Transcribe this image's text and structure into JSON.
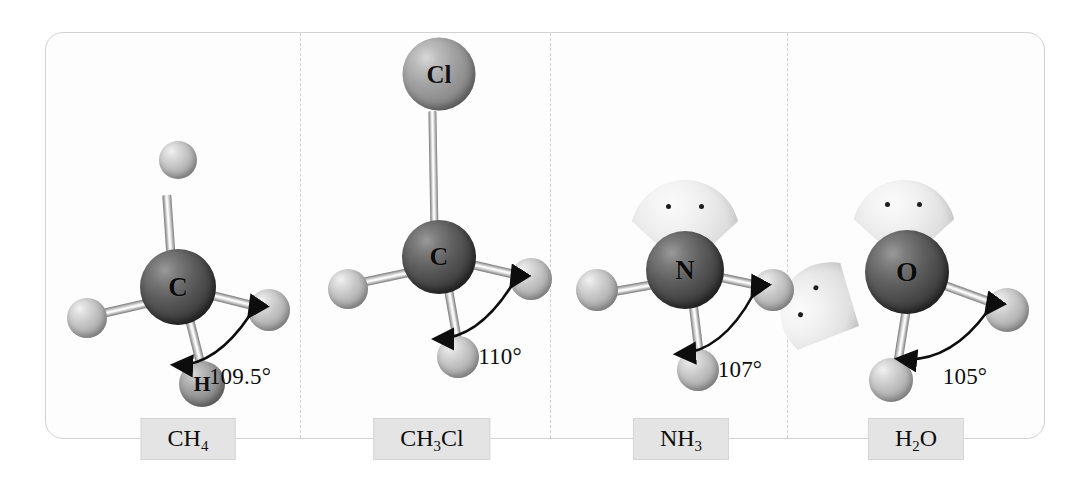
{
  "figure": {
    "background_color": "#ffffff",
    "frame_color": "#d2d2d2",
    "divider_color": "#cfcfcf",
    "chip_color": "#e4e4e4"
  },
  "panels": [
    {
      "id": "ch4",
      "formula_html": "CH<sub>4</sub>",
      "formula_text": "CH4",
      "central_atom": "C",
      "central_shade": "dark",
      "angle": "109.5°",
      "lone_pairs": 0,
      "terminal_atoms": [
        {
          "label": "",
          "shade": "light",
          "position": "top"
        },
        {
          "label": "",
          "shade": "light",
          "position": "left"
        },
        {
          "label": "H",
          "shade": "mid",
          "position": "bottom"
        },
        {
          "label": "",
          "shade": "light",
          "position": "right"
        }
      ]
    },
    {
      "id": "ch3cl",
      "formula_html": "CH<sub>3</sub>Cl",
      "formula_text": "CH3Cl",
      "central_atom": "C",
      "central_shade": "dark",
      "angle": "110°",
      "lone_pairs": 0,
      "terminal_atoms": [
        {
          "label": "Cl",
          "shade": "mid",
          "position": "top"
        },
        {
          "label": "",
          "shade": "light",
          "position": "left"
        },
        {
          "label": "",
          "shade": "light",
          "position": "bottom"
        },
        {
          "label": "",
          "shade": "light",
          "position": "right"
        }
      ]
    },
    {
      "id": "nh3",
      "formula_html": "NH<sub>3</sub>",
      "formula_text": "NH3",
      "central_atom": "N",
      "central_shade": "dark",
      "angle": "107°",
      "lone_pairs": 1,
      "terminal_atoms": [
        {
          "label": "",
          "shade": "light",
          "position": "left"
        },
        {
          "label": "",
          "shade": "light",
          "position": "bottom"
        },
        {
          "label": "",
          "shade": "light",
          "position": "right"
        }
      ]
    },
    {
      "id": "h2o",
      "formula_html": "H<sub>2</sub>O",
      "formula_text": "H2O",
      "central_atom": "O",
      "central_shade": "dark",
      "angle": "105°",
      "lone_pairs": 2,
      "terminal_atoms": [
        {
          "label": "",
          "shade": "light",
          "position": "bottom-left"
        },
        {
          "label": "",
          "shade": "light",
          "position": "right"
        }
      ]
    }
  ],
  "labels": {
    "ch4_angle": "109.5°",
    "ch3cl_angle": "110°",
    "nh3_angle": "107°",
    "h2o_angle": "105°",
    "ch4_atom_c": "C",
    "ch4_atom_h": "H",
    "ch3cl_atom_c": "C",
    "ch3cl_atom_cl": "Cl",
    "nh3_atom_n": "N",
    "h2o_atom_o": "O"
  }
}
